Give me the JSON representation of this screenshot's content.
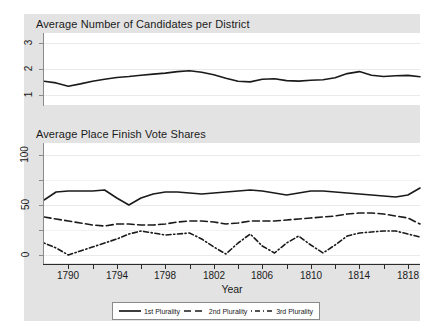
{
  "figure": {
    "background": "#e3e3e3",
    "canvas_color": "#ffffff",
    "line_color": "#1a1a1a"
  },
  "panels": {
    "top": {
      "title": "Average Number of Candidates per District"
    },
    "bottom": {
      "title": "Average Place Finish Vote Shares"
    }
  },
  "axis": {
    "x_title": "Year",
    "x_ticklabels": [
      "1790",
      "1794",
      "1798",
      "1802",
      "1806",
      "1810",
      "1814",
      "1818"
    ],
    "y_ticklabels_top": [
      "1",
      "2",
      "3"
    ],
    "y_ticklabels_bottom": [
      "0",
      "50",
      "100"
    ]
  },
  "legend": {
    "entries": [
      {
        "label": "1st Plurality",
        "style": "solid"
      },
      {
        "label": "2nd Plurality",
        "style": "dashed"
      },
      {
        "label": "3rd Plurality",
        "style": "dash-dot"
      }
    ]
  },
  "chart_data": [
    {
      "type": "line",
      "title": "Average Number of Candidates per District",
      "xlabel": "Year",
      "ylabel": "",
      "xlim": [
        1788,
        1819
      ],
      "ylim": [
        0.6,
        3.4
      ],
      "yticks": [
        1,
        2,
        3
      ],
      "xticks": [
        1790,
        1794,
        1798,
        1802,
        1806,
        1810,
        1814,
        1818
      ],
      "grid": true,
      "legend": "none",
      "x": [
        1788,
        1789,
        1790,
        1791,
        1792,
        1793,
        1794,
        1795,
        1796,
        1797,
        1798,
        1799,
        1800,
        1801,
        1802,
        1803,
        1804,
        1805,
        1806,
        1807,
        1808,
        1809,
        1810,
        1811,
        1812,
        1813,
        1814,
        1815,
        1816,
        1817,
        1818,
        1819
      ],
      "series": [
        {
          "name": "Average candidates per district",
          "values": [
            1.52,
            1.46,
            1.33,
            1.42,
            1.52,
            1.6,
            1.67,
            1.71,
            1.76,
            1.8,
            1.84,
            1.9,
            1.93,
            1.87,
            1.78,
            1.64,
            1.52,
            1.5,
            1.6,
            1.62,
            1.55,
            1.53,
            1.56,
            1.58,
            1.66,
            1.82,
            1.9,
            1.76,
            1.71,
            1.74,
            1.75,
            1.7,
            1.62,
            1.55
          ]
        }
      ]
    },
    {
      "type": "line",
      "title": "Average Place Finish Vote Shares",
      "xlabel": "Year",
      "ylabel": "",
      "xlim": [
        1788,
        1819
      ],
      "ylim": [
        -8,
        112
      ],
      "yticks": [
        0,
        25,
        50,
        75,
        100
      ],
      "yticklabels_shown": [
        0,
        50,
        100
      ],
      "xticks": [
        1790,
        1794,
        1798,
        1802,
        1806,
        1810,
        1814,
        1818
      ],
      "grid": true,
      "legend": "bottom",
      "x": [
        1788,
        1789,
        1790,
        1791,
        1792,
        1793,
        1794,
        1795,
        1796,
        1797,
        1798,
        1799,
        1800,
        1801,
        1802,
        1803,
        1804,
        1805,
        1806,
        1807,
        1808,
        1809,
        1810,
        1811,
        1812,
        1813,
        1814,
        1815,
        1816,
        1817,
        1818,
        1819
      ],
      "series": [
        {
          "name": "1st Plurality",
          "style": "solid",
          "values": [
            55,
            63,
            64,
            64,
            64,
            65,
            57,
            50,
            57,
            61,
            63,
            63,
            62,
            61,
            62,
            63,
            64,
            65,
            64,
            62,
            60,
            62,
            64,
            64,
            63,
            62,
            61,
            60,
            59,
            58,
            60,
            67
          ]
        },
        {
          "name": "2nd Plurality",
          "style": "dashed",
          "values": [
            38,
            36,
            34,
            32,
            30,
            29,
            31,
            31,
            30,
            30,
            31,
            33,
            34,
            34,
            33,
            31,
            32,
            34,
            34,
            34,
            35,
            36,
            37,
            38,
            39,
            41,
            42,
            42,
            41,
            39,
            37,
            31
          ]
        },
        {
          "name": "3rd Plurality",
          "style": "dash-dot",
          "values": [
            12,
            7,
            0,
            4,
            8,
            12,
            16,
            21,
            24,
            22,
            20,
            21,
            22,
            16,
            8,
            1,
            12,
            21,
            9,
            2,
            12,
            19,
            10,
            2,
            10,
            19,
            22,
            23,
            24,
            24,
            21,
            18
          ]
        }
      ]
    }
  ]
}
